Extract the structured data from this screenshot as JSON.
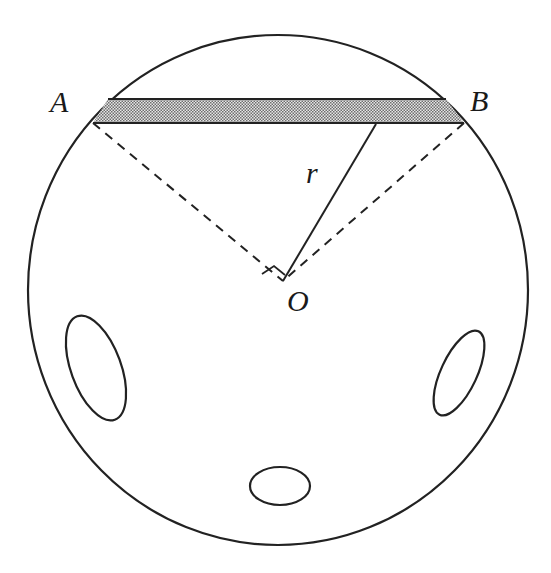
{
  "diagram": {
    "type": "geometry",
    "labels": {
      "A": "A",
      "B": "B",
      "r": "r",
      "O": "O"
    },
    "colors": {
      "stroke": "#222222",
      "shading": "#bdbdbd",
      "background": "#ffffff"
    },
    "shapes": {
      "outer_circle": {
        "cx": 278,
        "cy": 290,
        "rx": 250,
        "ry": 255
      },
      "chord_strip": {
        "top_y": 99,
        "bottom_y": 123,
        "left_top_x": 108,
        "right_top_x": 446,
        "left_bottom_x": 93,
        "right_bottom_x": 464
      },
      "radius_line": {
        "from": [
          376,
          124
        ],
        "to": [
          283,
          281
        ]
      },
      "dashed_OA": {
        "from": [
          93,
          123
        ],
        "to": [
          283,
          281
        ]
      },
      "dashed_OB": {
        "from": [
          464,
          123
        ],
        "to": [
          283,
          281
        ]
      },
      "right_angle_mark": "at O between OA and OB",
      "holes": [
        {
          "name": "left-hole",
          "cx": 96,
          "cy": 368,
          "rx": 25,
          "ry": 55,
          "rotate": -20
        },
        {
          "name": "right-hole",
          "cx": 459,
          "cy": 373,
          "rx": 18,
          "ry": 46,
          "rotate": 25
        },
        {
          "name": "bottom-hole",
          "cx": 280,
          "cy": 486,
          "rx": 30,
          "ry": 19,
          "rotate": 0
        }
      ]
    }
  }
}
